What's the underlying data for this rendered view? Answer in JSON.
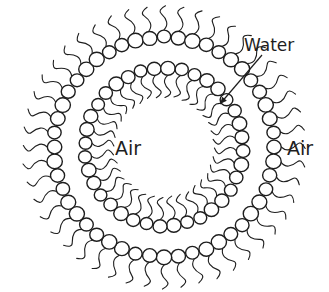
{
  "diagram": {
    "type": "soap-bubble-cross-section",
    "labels": {
      "water": "Water",
      "air_inside": "Air",
      "air_outside": "Air"
    },
    "colors": {
      "stroke": "#1e1e1e",
      "background": "#ffffff"
    },
    "geometry": {
      "center": [
        164,
        147
      ],
      "outer_ring": {
        "radius": 110,
        "head_radius": 7.2,
        "count": 48,
        "tail_direction": "outward",
        "tail_length": 24
      },
      "inner_ring": {
        "radius": 79,
        "head_radius": 6.8,
        "count": 36,
        "tail_direction": "inward",
        "tail_length": 22
      },
      "water_arrow": {
        "from": [
          262,
          55
        ],
        "to": [
          220,
          104
        ]
      }
    }
  }
}
